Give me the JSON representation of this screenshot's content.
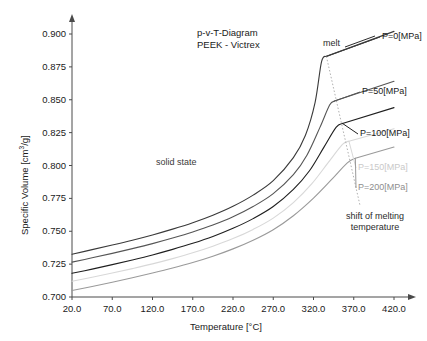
{
  "chart_data": {
    "type": "line",
    "title": "p-v-T-Diagram",
    "subtitle": "PEEK - Victrex",
    "xlabel": "Temperature [°C]",
    "ylabel_prefix": "Specific Volume [cm",
    "ylabel_sup": "3",
    "ylabel_suffix": "/g]",
    "xlim": [
      20,
      420
    ],
    "ylim": [
      0.7,
      0.9
    ],
    "xticks": [
      "20.0",
      "70.0",
      "120.0",
      "170.0",
      "220.0",
      "270.0",
      "320.0",
      "370.0",
      "420.0"
    ],
    "xtick_values": [
      20,
      70,
      120,
      170,
      220,
      270,
      320,
      370,
      420
    ],
    "yticks": [
      "0.700",
      "0.725",
      "0.750",
      "0.775",
      "0.800",
      "0.825",
      "0.850",
      "0.875",
      "0.900"
    ],
    "ytick_values": [
      0.7,
      0.725,
      0.75,
      0.775,
      0.8,
      0.825,
      0.85,
      0.875,
      0.9
    ],
    "grid": false,
    "legend_position": "right-inline-labels",
    "series": [
      {
        "name": "P=0[MPa]",
        "color": "#3a3a3a",
        "label_x": 382,
        "label_y": 31,
        "points": [
          [
            20,
            0.7325
          ],
          [
            45,
            0.736
          ],
          [
            70,
            0.7395
          ],
          [
            95,
            0.7432
          ],
          [
            120,
            0.7472
          ],
          [
            145,
            0.7516
          ],
          [
            170,
            0.7565
          ],
          [
            195,
            0.7622
          ],
          [
            220,
            0.769
          ],
          [
            245,
            0.7775
          ],
          [
            270,
            0.7885
          ],
          [
            295,
            0.806
          ],
          [
            310,
            0.823
          ],
          [
            322,
            0.848
          ],
          [
            330,
            0.879
          ],
          [
            336,
            0.883
          ],
          [
            420,
            0.902
          ]
        ],
        "melt_x": 336,
        "melt_v": 0.883
      },
      {
        "name": "P=50[MPa]",
        "color": "#555555",
        "label_x": 362,
        "label_y": 86,
        "points": [
          [
            20,
            0.7265
          ],
          [
            45,
            0.7298
          ],
          [
            70,
            0.7332
          ],
          [
            95,
            0.7368
          ],
          [
            120,
            0.7406
          ],
          [
            145,
            0.7448
          ],
          [
            170,
            0.7494
          ],
          [
            195,
            0.7547
          ],
          [
            220,
            0.761
          ],
          [
            245,
            0.7688
          ],
          [
            270,
            0.7786
          ],
          [
            295,
            0.793
          ],
          [
            312,
            0.808
          ],
          [
            328,
            0.829
          ],
          [
            340,
            0.846
          ],
          [
            346,
            0.849
          ],
          [
            420,
            0.864
          ]
        ],
        "melt_x": 346,
        "melt_v": 0.849
      },
      {
        "name": "P=100[MPa]",
        "color": "#1f1f1f",
        "label_x": 360,
        "label_y": 128,
        "points": [
          [
            20,
            0.718
          ],
          [
            45,
            0.7212
          ],
          [
            70,
            0.7246
          ],
          [
            95,
            0.7282
          ],
          [
            120,
            0.732
          ],
          [
            145,
            0.7362
          ],
          [
            170,
            0.7408
          ],
          [
            195,
            0.746
          ],
          [
            220,
            0.7522
          ],
          [
            245,
            0.7596
          ],
          [
            270,
            0.7688
          ],
          [
            295,
            0.7818
          ],
          [
            315,
            0.796
          ],
          [
            333,
            0.814
          ],
          [
            348,
            0.829
          ],
          [
            356,
            0.832
          ],
          [
            420,
            0.844
          ]
        ],
        "melt_x": 356,
        "melt_v": 0.832
      },
      {
        "name": "P=150[MPa]",
        "color": "#d8d8d8",
        "label_x": 358,
        "label_y": 162,
        "points": [
          [
            20,
            0.712
          ],
          [
            45,
            0.715
          ],
          [
            70,
            0.7182
          ],
          [
            95,
            0.7216
          ],
          [
            120,
            0.7252
          ],
          [
            145,
            0.7292
          ],
          [
            170,
            0.7336
          ],
          [
            195,
            0.7386
          ],
          [
            220,
            0.7444
          ],
          [
            245,
            0.7514
          ],
          [
            270,
            0.76
          ],
          [
            295,
            0.7718
          ],
          [
            318,
            0.7862
          ],
          [
            338,
            0.802
          ],
          [
            356,
            0.816
          ],
          [
            364,
            0.8185
          ],
          [
            420,
            0.828
          ]
        ],
        "melt_x": 364,
        "melt_v": 0.8185
      },
      {
        "name": "P=200[MPa]",
        "color": "#9a9a9a",
        "label_x": 358,
        "label_y": 182,
        "points": [
          [
            20,
            0.705
          ],
          [
            45,
            0.708
          ],
          [
            70,
            0.7112
          ],
          [
            95,
            0.7146
          ],
          [
            120,
            0.7182
          ],
          [
            145,
            0.722
          ],
          [
            170,
            0.7262
          ],
          [
            195,
            0.731
          ],
          [
            220,
            0.7366
          ],
          [
            245,
            0.7432
          ],
          [
            270,
            0.7512
          ],
          [
            295,
            0.7618
          ],
          [
            320,
            0.7752
          ],
          [
            342,
            0.789
          ],
          [
            362,
            0.802
          ],
          [
            372,
            0.8055
          ],
          [
            420,
            0.814
          ]
        ],
        "melt_x": 372,
        "melt_v": 0.8055
      }
    ],
    "shift_line": {
      "label": "shift of melting",
      "label2": "temperature",
      "from": [
        336,
        0.883
      ],
      "to": [
        378,
        0.769
      ],
      "color": "#b0b0b0",
      "style": "dotted"
    },
    "annotations": [
      {
        "name": "solid-state-label",
        "text": "solid state",
        "x": 156,
        "y": 157,
        "color": "#3a3a3a"
      },
      {
        "name": "melt-label",
        "text": "melt",
        "x": 323,
        "y": 38,
        "color": "#2b2b2b"
      }
    ]
  }
}
